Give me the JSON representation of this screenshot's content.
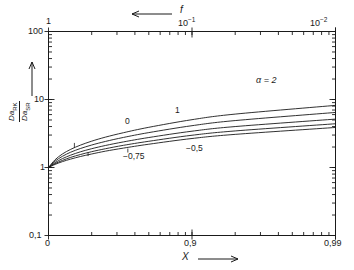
{
  "chart_data": {
    "type": "line",
    "title": "",
    "xlabel": "X",
    "ylabel": "Da|RK / Da|SR",
    "top_axis_label": "f",
    "xscale": "neg-log(1-X)",
    "yscale": "log",
    "ylim": [
      0.1,
      100
    ],
    "y_ticks": [
      "0,1",
      "1",
      "10",
      "100"
    ],
    "x_ticks": [
      "0",
      "0,9",
      "0,99"
    ],
    "top_ticks": [
      "1",
      "10",
      "10"
    ],
    "top_tick_labels": [
      "1",
      "10⁻¹",
      "10⁻²"
    ],
    "top_tick_exponents": [
      "",
      "-1",
      "-2"
    ],
    "grid": false,
    "legend": "inline-curve-labels",
    "x": [
      0,
      0.1,
      0.2,
      0.3,
      0.4,
      0.5,
      0.6,
      0.7,
      0.8,
      0.9,
      0.95,
      0.99
    ],
    "series": [
      {
        "name": "α = 2",
        "label": "α = 2",
        "values": [
          1.0,
          1.3,
          1.58,
          1.85,
          2.13,
          2.44,
          2.8,
          3.25,
          3.9,
          5.05,
          6.1,
          8.2
        ]
      },
      {
        "name": "1",
        "label": "1",
        "values": [
          1.0,
          1.24,
          1.46,
          1.68,
          1.9,
          2.14,
          2.42,
          2.77,
          3.26,
          4.12,
          4.9,
          6.45
        ]
      },
      {
        "name": "0",
        "label": "0",
        "values": [
          1.0,
          1.18,
          1.35,
          1.52,
          1.7,
          1.89,
          2.11,
          2.38,
          2.76,
          3.42,
          4.0,
          5.15
        ]
      },
      {
        "name": "-0,5",
        "label": "−0,5",
        "values": [
          1.0,
          1.14,
          1.27,
          1.41,
          1.55,
          1.71,
          1.89,
          2.12,
          2.43,
          2.98,
          3.45,
          4.4
        ]
      },
      {
        "name": "-0,75",
        "label": "−0,75",
        "values": [
          1.0,
          1.11,
          1.22,
          1.33,
          1.45,
          1.58,
          1.74,
          1.93,
          2.2,
          2.67,
          3.07,
          3.88
        ]
      }
    ],
    "annotations": [
      {
        "text": "α = 2",
        "x": 0.91,
        "y": 9.0
      },
      {
        "text": "1",
        "x": 0.565,
        "y": 3.3
      },
      {
        "text": "0",
        "x": 0.34,
        "y": 2.55
      },
      {
        "text": "−0,5",
        "x": 0.72,
        "y": 1.72
      },
      {
        "text": "−0,75",
        "x": 0.46,
        "y": 1.42
      }
    ]
  },
  "axes": {
    "y_label_numerator_base": "Da",
    "y_label_numerator_sub": "RK",
    "y_label_denominator_base": "Da",
    "y_label_denominator_sub": "SR",
    "y_tick_100": "100",
    "y_tick_10": "10",
    "y_tick_1": "1",
    "y_tick_01": "0,1",
    "x_tick_0": "0",
    "x_tick_09": "0,9",
    "x_tick_099": "0,99",
    "x_name": "X",
    "top_name": "f",
    "top_tick_1": "1",
    "top_tick_m1_mantissa": "10",
    "top_tick_m1_exp": "−1",
    "top_tick_m2_mantissa": "10",
    "top_tick_m2_exp": "−2"
  },
  "curve_labels": {
    "alpha2": "α = 2",
    "one": "1",
    "zero": "0",
    "mhalf": "−0,5",
    "mthreequarter": "−0,75"
  },
  "colors": {
    "ink": "#1a1a1a",
    "background": "#ffffff"
  }
}
